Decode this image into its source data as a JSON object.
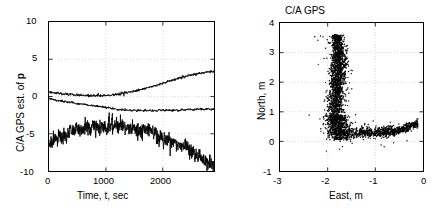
{
  "figure": {
    "background_color": "#ffffff",
    "line_color": "#000000",
    "grid_color": "#c8c8c8",
    "marker_color": "#000000"
  },
  "chart_data": [
    {
      "type": "line",
      "panel": "left",
      "title": "",
      "xlabel": "Time, t, sec",
      "ylabel": "C/A GPS est. of p",
      "ylabel_bold_token": "p",
      "xlim": [
        0,
        2900
      ],
      "ylim": [
        -10,
        10
      ],
      "xticks": [
        0,
        1000,
        2000
      ],
      "xticklabels": [
        "0",
        "1000",
        "2000"
      ],
      "yticks": [
        -10,
        -5,
        0,
        5,
        10
      ],
      "yticklabels": [
        "-10",
        "-5",
        "0",
        "5",
        "10"
      ],
      "grid": true,
      "legend": "none",
      "series": [
        {
          "name": "east component",
          "x": [
            0,
            100,
            200,
            300,
            400,
            500,
            600,
            700,
            800,
            900,
            1000,
            1100,
            1200,
            1300,
            1400,
            1500,
            1600,
            1700,
            1800,
            1900,
            2000,
            2100,
            2200,
            2300,
            2400,
            2500,
            2600,
            2700,
            2800,
            2900
          ],
          "values": [
            0.65,
            0.5,
            0.4,
            0.32,
            0.25,
            0.2,
            0.15,
            0.12,
            0.1,
            0.12,
            0.15,
            0.2,
            0.3,
            0.42,
            0.55,
            0.7,
            0.9,
            1.1,
            1.3,
            1.5,
            1.75,
            2.0,
            2.25,
            2.5,
            2.7,
            2.9,
            3.05,
            3.15,
            3.25,
            3.35
          ],
          "noise_amplitude": 0.12
        },
        {
          "name": "north component",
          "x": [
            0,
            100,
            200,
            300,
            400,
            500,
            600,
            700,
            800,
            900,
            1000,
            1100,
            1200,
            1300,
            1400,
            1500,
            1600,
            1700,
            1800,
            1900,
            2000,
            2100,
            2200,
            2300,
            2400,
            2500,
            2600,
            2700,
            2800,
            2900
          ],
          "values": [
            -0.3,
            -0.45,
            -0.6,
            -0.72,
            -0.85,
            -0.95,
            -1.05,
            -1.15,
            -1.25,
            -1.35,
            -1.45,
            -1.6,
            -1.75,
            -1.82,
            -1.86,
            -1.88,
            -1.9,
            -1.9,
            -1.9,
            -1.88,
            -1.86,
            -1.84,
            -1.82,
            -1.8,
            -1.78,
            -1.76,
            -1.74,
            -1.72,
            -1.7,
            -1.68
          ],
          "noise_amplitude": 0.1
        },
        {
          "name": "vertical component",
          "x": [
            0,
            100,
            200,
            300,
            400,
            500,
            600,
            700,
            800,
            900,
            1000,
            1100,
            1200,
            1300,
            1400,
            1500,
            1600,
            1700,
            1800,
            1900,
            2000,
            2100,
            2200,
            2300,
            2400,
            2500,
            2600,
            2700,
            2800,
            2900
          ],
          "values": [
            -6.0,
            -5.7,
            -5.4,
            -5.1,
            -4.8,
            -4.5,
            -4.3,
            -4.2,
            -4.25,
            -4.2,
            -4.0,
            -3.8,
            -3.9,
            -4.1,
            -4.3,
            -4.4,
            -4.5,
            -4.6,
            -4.8,
            -5.3,
            -5.6,
            -6.0,
            -6.3,
            -6.6,
            -6.8,
            -7.3,
            -7.8,
            -8.4,
            -8.9,
            -9.4
          ],
          "noise_amplitude": 0.75
        }
      ]
    },
    {
      "type": "scatter",
      "panel": "right",
      "title": "C/A GPS",
      "xlabel": "East, m",
      "ylabel": "North, m",
      "xlim": [
        -3,
        0
      ],
      "ylim": [
        -1,
        4
      ],
      "xticks": [
        -3,
        -2,
        -1,
        0
      ],
      "xticklabels": [
        "-3",
        "-2",
        "-1",
        "0"
      ],
      "yticks": [
        -1,
        0,
        1,
        2,
        3,
        4
      ],
      "yticklabels": [
        "-1",
        "0",
        "1",
        "2",
        "3",
        "4"
      ],
      "grid": true,
      "legend": "none",
      "marker": "dot",
      "marker_size": 1,
      "point_count": 2900,
      "cloud_shape": "J-shaped / checkmark track: dense vertical arm near East=-1.8 spanning North 0.3 to 3.6, curving at the bottom into a horizontal arm running East -2.0 to -0.1 at North 0.1 to 0.7",
      "description_segments": [
        {
          "name": "vertical-arm",
          "east_center": -1.8,
          "east_spread": 0.16,
          "north_range": [
            0.6,
            3.6
          ],
          "density": 0.52
        },
        {
          "name": "elbow",
          "east_center": -1.75,
          "east_spread": 0.18,
          "north_range": [
            0.1,
            0.8
          ],
          "density": 0.18
        },
        {
          "name": "horizontal-arm",
          "east_range": [
            -2.0,
            -0.1
          ],
          "north_center": 0.35,
          "north_spread": 0.22,
          "density": 0.3
        }
      ]
    }
  ]
}
